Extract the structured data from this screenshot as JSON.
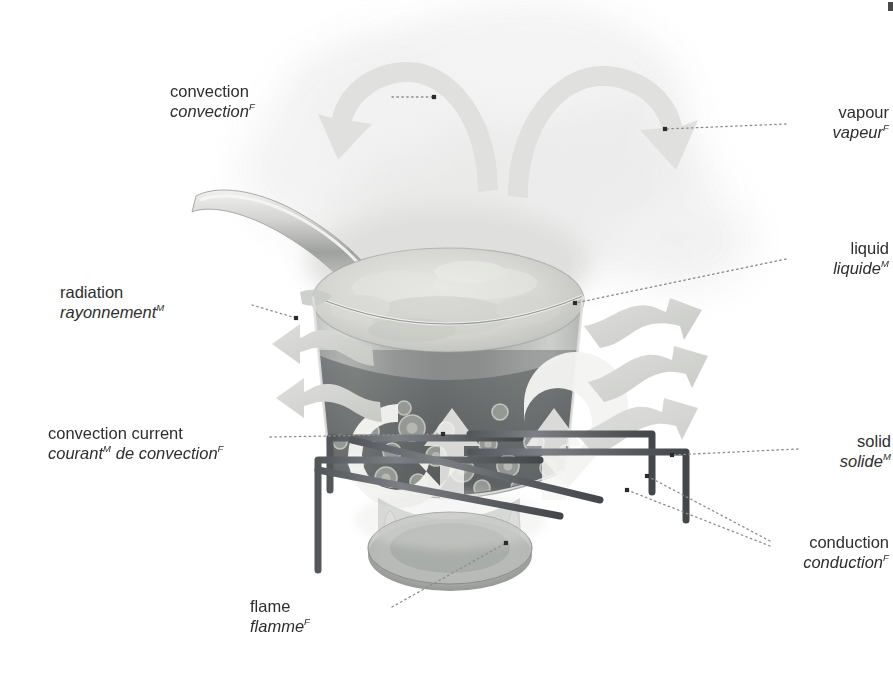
{
  "illustration": {
    "title": "heat transfer in a boiling pot",
    "palette": {
      "background": "#ffffff",
      "text": "#2e2e2e",
      "leader_line": "#8d8d8d",
      "leader_dot": "#2b2b2b",
      "arrow_light": "#d9dad8",
      "arrow_white": "#f4f4f2",
      "steam": "#efefee",
      "pot_glass": "#b9bcb9",
      "liquid_dark": "#6e7270",
      "liquid_foam": "#d5d6d2",
      "metal_grate": "#6a6d6a",
      "flame": "#a8aaa6",
      "burner": "#9a9d99"
    }
  },
  "labels": [
    {
      "id": "convection",
      "en": "convection",
      "fr": "convection",
      "fr_gender": "F",
      "align": "right",
      "x": 170,
      "y": 82,
      "width": 215
    },
    {
      "id": "vapour",
      "en": "vapour",
      "fr": "vapeur",
      "fr_gender": "F",
      "align": "left",
      "x": 794,
      "y": 103,
      "width": 95
    },
    {
      "id": "liquid",
      "en": "liquid",
      "fr": "liquide",
      "fr_gender": "M",
      "align": "left",
      "x": 794,
      "y": 239,
      "width": 95
    },
    {
      "id": "radiation",
      "en": "radiation",
      "fr": "rayonnement",
      "fr_gender": "M",
      "align": "right",
      "x": 60,
      "y": 283,
      "width": 186
    },
    {
      "id": "convection-current",
      "en": "convection current",
      "fr": "courant",
      "fr_extra": " de convection",
      "fr_gender": "M",
      "fr_gender2": "F",
      "align": "right",
      "x": 48,
      "y": 424,
      "width": 215
    },
    {
      "id": "solid",
      "en": "solid",
      "fr": "solide",
      "fr_gender": "M",
      "align": "left",
      "x": 806,
      "y": 432,
      "width": 85
    },
    {
      "id": "conduction",
      "en": "conduction",
      "fr": "conduction",
      "fr_gender": "F",
      "align": "left",
      "x": 777,
      "y": 533,
      "width": 112
    },
    {
      "id": "flame",
      "en": "flame",
      "fr": "flamme",
      "fr_gender": "F",
      "align": "right",
      "x": 250,
      "y": 597,
      "width": 135
    }
  ],
  "leaders": [
    {
      "id": "leader-convection",
      "from": [
        392,
        97
      ],
      "to": [
        434,
        97
      ]
    },
    {
      "id": "leader-vapour",
      "from": [
        786,
        124
      ],
      "to": [
        665,
        129
      ]
    },
    {
      "id": "leader-liquid",
      "from": [
        786,
        259
      ],
      "to": [
        575,
        303
      ]
    },
    {
      "id": "leader-radiation",
      "from": [
        252,
        305
      ],
      "to": [
        296,
        318
      ]
    },
    {
      "id": "leader-convection-current",
      "from": [
        270,
        437
      ],
      "to": [
        443,
        434
      ]
    },
    {
      "id": "leader-solid",
      "from": [
        798,
        449
      ],
      "to": [
        672,
        455
      ]
    },
    {
      "id": "leader-conduction-a",
      "from": [
        770,
        541
      ],
      "to": [
        647,
        476
      ]
    },
    {
      "id": "leader-conduction-b",
      "from": [
        770,
        546
      ],
      "to": [
        627,
        490
      ]
    },
    {
      "id": "leader-flame",
      "from": [
        392,
        607
      ],
      "to": [
        506,
        543
      ]
    }
  ],
  "annotations": {
    "steam_arrows": 2,
    "radiation_arrows_left": 2,
    "radiation_arrows_right": 3,
    "convection_arrows_in_pot": 2,
    "burner_grate_bars": 6
  }
}
